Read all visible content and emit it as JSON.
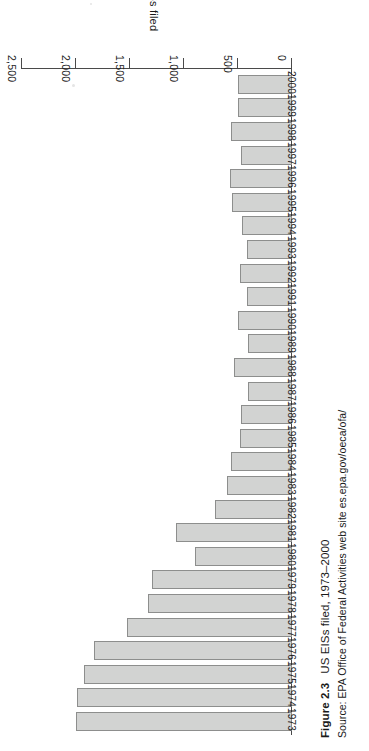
{
  "figure": {
    "number": "Figure 2.3",
    "title": "US EISs filed, 1973–2000",
    "source": "Source: EPA Office of Federal Activities web site es.epa.gov/oeca/ofa/"
  },
  "colors": {
    "bar_fill": "#d2d3d2",
    "bar_stroke": "#8d8e8d",
    "axis": "#4a4a4a",
    "text": "#1a1a1a",
    "background": "#ffffff"
  },
  "chart_data": {
    "type": "bar",
    "orientation": "horizontal",
    "title": "US EISs filed, 1973–2000",
    "xlabel": "EISs filed",
    "ylabel": "",
    "xlim": [
      0,
      2500
    ],
    "grid": false,
    "legend": null,
    "tick_labels": [
      "0",
      "500",
      "1,000",
      "1,500",
      "2,000",
      "2,500"
    ],
    "ticks": [
      0,
      500,
      1000,
      1500,
      2000,
      2500
    ],
    "categories": [
      "1973",
      "1974",
      "1975",
      "1976",
      "1977",
      "1978",
      "1979",
      "1980",
      "1981",
      "1982",
      "1983",
      "1984",
      "1985",
      "1986",
      "1987",
      "1988",
      "1989",
      "1990",
      "1991",
      "1992",
      "1993",
      "1994",
      "1995",
      "1996",
      "1997",
      "1998",
      "1999",
      "2000"
    ],
    "values": [
      2000,
      1990,
      1925,
      1835,
      1530,
      1335,
      1295,
      900,
      1075,
      715,
      600,
      565,
      480,
      470,
      405,
      535,
      405,
      500,
      415,
      480,
      415,
      465,
      555,
      575,
      470,
      565,
      500,
      500
    ]
  }
}
